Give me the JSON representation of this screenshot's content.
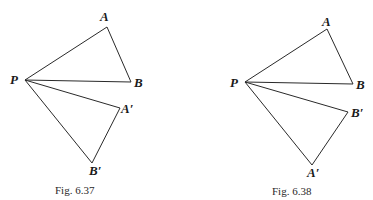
{
  "figures": [
    {
      "caption": "Fig. 6.37",
      "vertices": {
        "P": {
          "label": "P",
          "x": 25,
          "y": 80
        },
        "A": {
          "label": "A",
          "x": 107,
          "y": 27
        },
        "B": {
          "label": "B",
          "x": 131,
          "y": 82
        },
        "A2": {
          "label": "A′",
          "x": 120,
          "y": 108
        },
        "B2": {
          "label": "B′",
          "x": 92,
          "y": 163
        }
      }
    },
    {
      "caption": "Fig. 6.38",
      "vertices": {
        "P": {
          "label": "P",
          "x": 245,
          "y": 82
        },
        "A": {
          "label": "A",
          "x": 327,
          "y": 29
        },
        "B": {
          "label": "B",
          "x": 353,
          "y": 84
        },
        "B2": {
          "label": "B′",
          "x": 348,
          "y": 112
        },
        "A2": {
          "label": "A′",
          "x": 312,
          "y": 165
        }
      }
    }
  ],
  "colors": {
    "stroke": "#2a2a2a",
    "text": "#1a1a1a"
  }
}
